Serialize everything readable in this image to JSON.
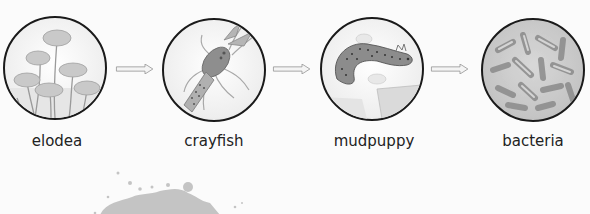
{
  "diagram": {
    "type": "food-chain-flow",
    "nodes": [
      {
        "id": "elodea",
        "label": "elodea",
        "icon": "elodea-plant-icon"
      },
      {
        "id": "crayfish",
        "label": "crayfish",
        "icon": "crayfish-icon"
      },
      {
        "id": "mudpuppy",
        "label": "mudpuppy",
        "icon": "mudpuppy-icon"
      },
      {
        "id": "bacteria",
        "label": "bacteria",
        "icon": "bacteria-icon"
      }
    ],
    "edges": [
      {
        "from": "elodea",
        "to": "crayfish"
      },
      {
        "from": "crayfish",
        "to": "mudpuppy"
      },
      {
        "from": "mudpuppy",
        "to": "bacteria"
      }
    ]
  },
  "colors": {
    "background": "#fbfbfb",
    "outline": "#1a1a1a",
    "fill_gray": "#b8b8b8",
    "text": "#222222"
  }
}
